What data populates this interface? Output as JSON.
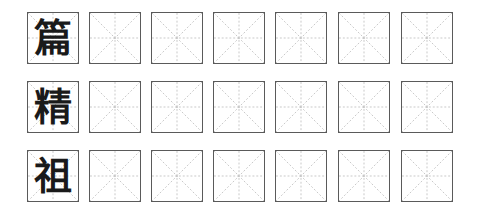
{
  "worksheet": {
    "grid_style": "mi-zi-ge",
    "columns_per_row": 7,
    "colors": {
      "border": "#5a5a5a",
      "guide": "#b8b8b8",
      "text": "#1a1a1a"
    },
    "rows": [
      {
        "character": "篇",
        "blank_cells": 6
      },
      {
        "character": "精",
        "blank_cells": 6
      },
      {
        "character": "祖",
        "blank_cells": 6
      }
    ]
  }
}
